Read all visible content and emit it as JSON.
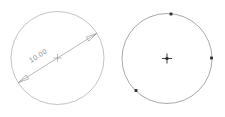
{
  "drawing": {
    "title": "CAD circle diameter dimension view",
    "background_color": "#ffffff",
    "geometry_color": "#9a9a9a",
    "dimension_color": "#8a8a8a",
    "grip_color": "#2b2b2b",
    "line_width": 0.6
  },
  "left_shape": {
    "name": "circle-unselected",
    "center_x": 57.5,
    "center_y": 58,
    "radius": 46.5,
    "center_marker": "cross",
    "center_marker_size": 4
  },
  "dimension": {
    "label": "10.00",
    "kind": "diameter",
    "start_x": 18.5,
    "start_y": 82.5,
    "end_x": 96.5,
    "end_y": 33.5,
    "arrow_start": true,
    "arrow_end": true,
    "text_x": 31,
    "text_y": 63,
    "text_rotation": -32
  },
  "right_shape": {
    "name": "circle-selected",
    "center_x": 167,
    "center_y": 58.5,
    "radius": 45,
    "center_marker": "cross",
    "center_marker_size": 5,
    "grips": [
      {
        "name": "grip-top",
        "x": 171,
        "y": 14
      },
      {
        "name": "grip-right",
        "x": 211.5,
        "y": 58
      },
      {
        "name": "grip-bottom-left",
        "x": 136,
        "y": 90.5
      }
    ]
  }
}
